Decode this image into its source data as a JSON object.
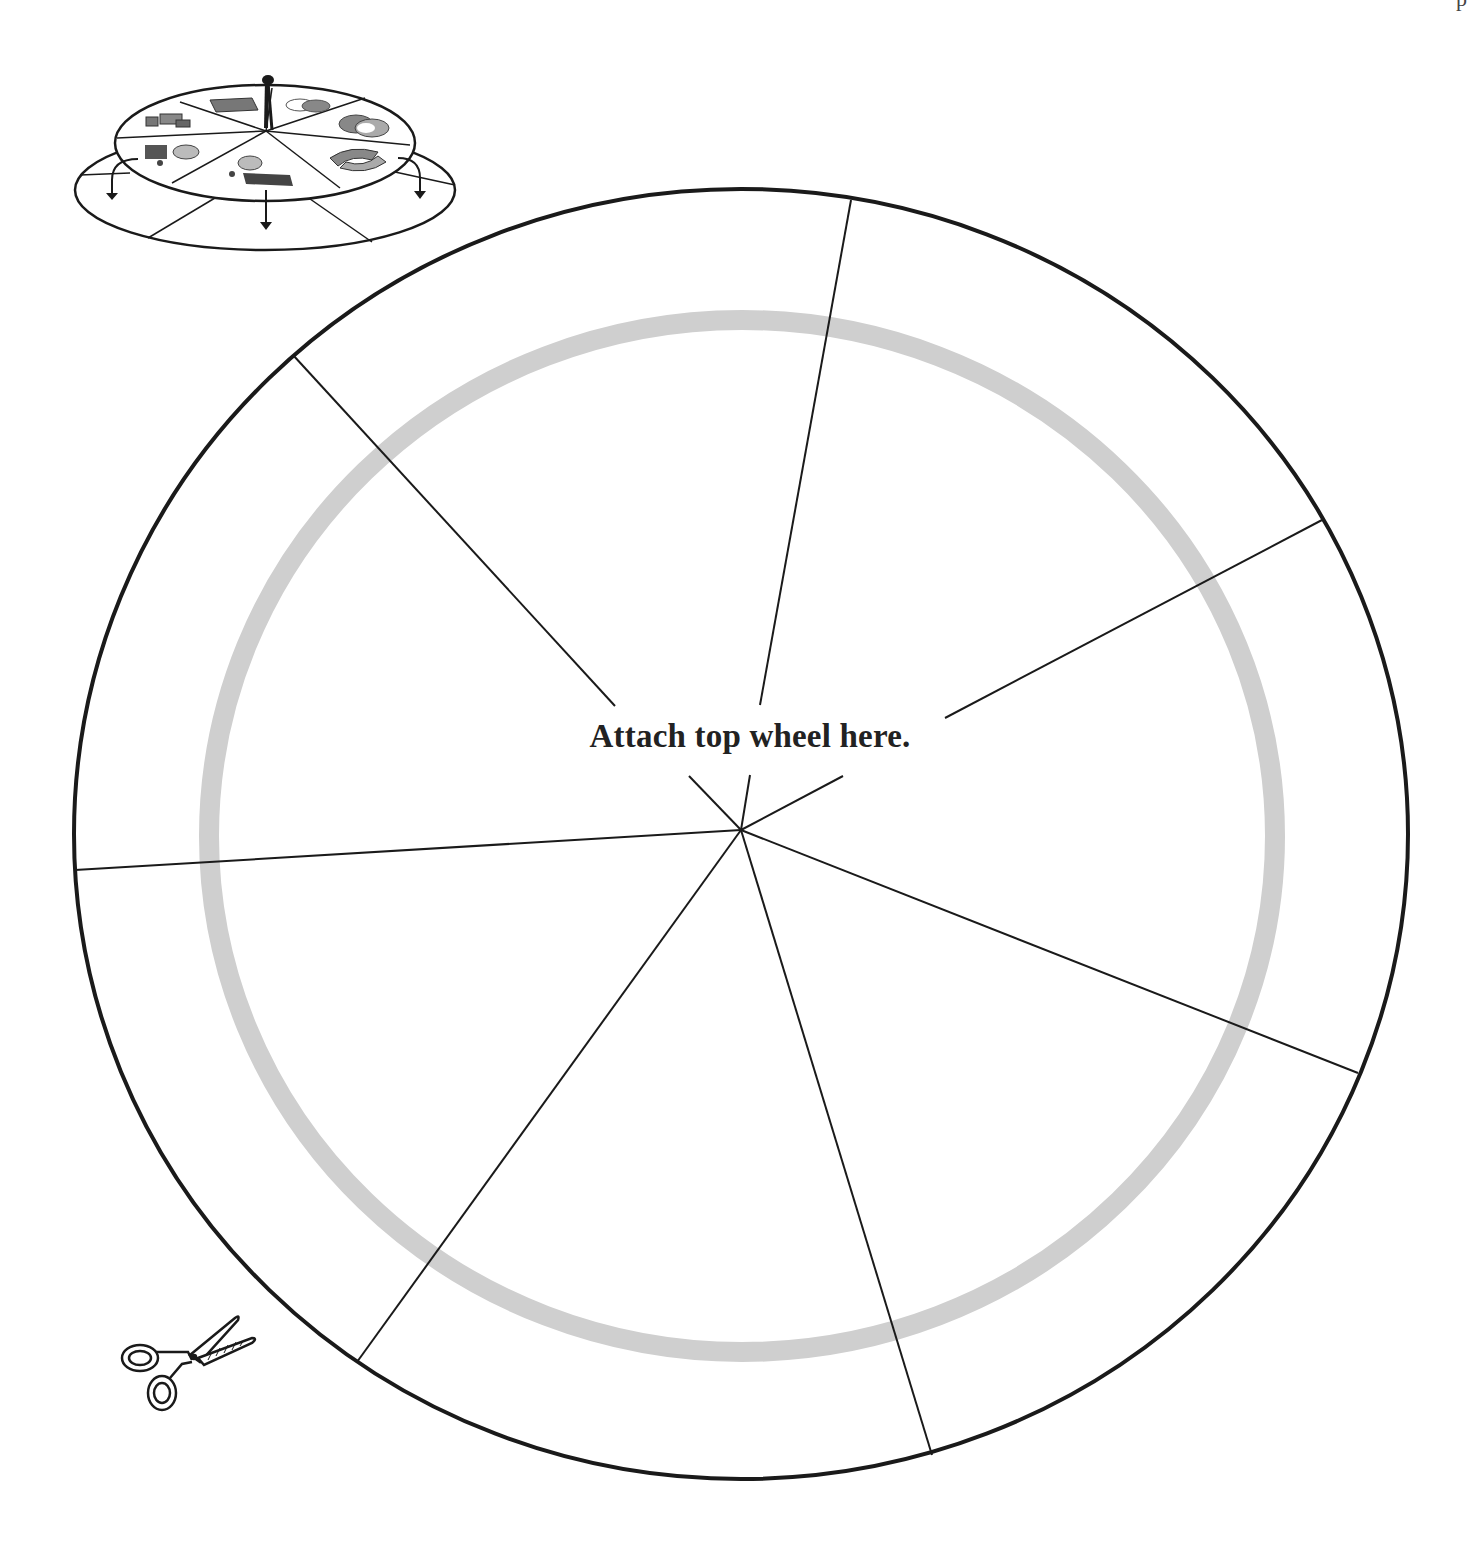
{
  "page": {
    "page_number_fragment": "p"
  },
  "wheel": {
    "instruction": "Attach top wheel here.",
    "segments": 8,
    "outer_circle": {
      "cx": 741,
      "cy": 834,
      "rx": 667,
      "ry": 645,
      "stroke": "#1a1a1a"
    },
    "guide_ring": {
      "cx": 742,
      "cy": 836,
      "rx": 533,
      "ry": 516,
      "stroke": "#cfcfcf",
      "width": 20
    },
    "hub": {
      "x": 741,
      "y": 830
    },
    "spokes": [
      {
        "name": "spoke-top",
        "x2": 851,
        "y2": 200
      },
      {
        "name": "spoke-upper-right",
        "x2": 1322,
        "y2": 520
      },
      {
        "name": "spoke-lower-right",
        "x2": 1358,
        "y2": 1073
      },
      {
        "name": "spoke-bottom-right",
        "x2": 932,
        "y2": 1455
      },
      {
        "name": "spoke-bottom-left",
        "x2": 357,
        "y2": 1362
      },
      {
        "name": "spoke-left",
        "x2": 75,
        "y2": 870
      },
      {
        "name": "spoke-upper-left",
        "x2": 293,
        "y2": 355
      }
    ]
  },
  "diagram": {
    "label": "assembly-illustration",
    "icons": [
      "document-icon",
      "venn-outline-icon",
      "venn-filled-icon",
      "recycle-arrows-icon",
      "scale-icon",
      "thought-bubble-left-icon",
      "thought-bubble-right-icon"
    ]
  },
  "scissors": {
    "label": "cut-line-indicator"
  },
  "colors": {
    "ink": "#1a1a1a",
    "ring": "#cfcfcf",
    "background": "#ffffff"
  }
}
